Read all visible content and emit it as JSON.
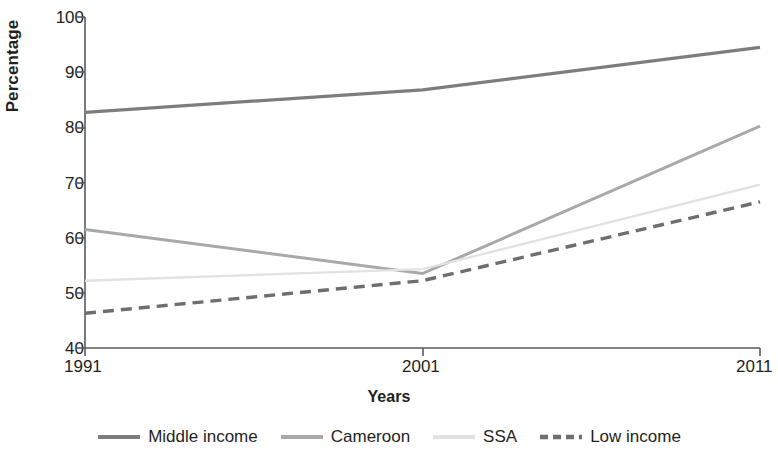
{
  "chart_data": {
    "type": "line",
    "title": "",
    "xlabel": "Years",
    "ylabel": "Percentage",
    "x": [
      1991,
      2001,
      2011
    ],
    "categories": [
      "1991",
      "2001",
      "2011"
    ],
    "xtick_labels": [
      "1991",
      "2001",
      "2011"
    ],
    "ytick_labels": [
      "40",
      "50",
      "60",
      "70",
      "80",
      "90",
      "100"
    ],
    "yticks": [
      40,
      50,
      60,
      70,
      80,
      90,
      100
    ],
    "ylim": [
      40,
      100
    ],
    "xlim": [
      1991,
      2011
    ],
    "grid": false,
    "legend_position": "bottom",
    "series": [
      {
        "name": "Middle income",
        "values": [
          82.7,
          86.8,
          94.5
        ],
        "color": "#7d7d7d",
        "style": "solid",
        "width": 3.2
      },
      {
        "name": "Cameroon",
        "values": [
          61.5,
          53.5,
          80.2
        ],
        "color": "#a9a9a9",
        "style": "solid",
        "width": 3.0
      },
      {
        "name": "SSA",
        "values": [
          52.2,
          54.3,
          69.6
        ],
        "color": "#e2e2e2",
        "style": "solid",
        "width": 2.4
      },
      {
        "name": "Low income",
        "values": [
          46.3,
          52.2,
          66.5
        ],
        "color": "#6e6e6e",
        "style": "dashed",
        "width": 3.4
      }
    ]
  },
  "legend": {
    "items": [
      {
        "label": "Middle income"
      },
      {
        "label": "Cameroon"
      },
      {
        "label": "SSA"
      },
      {
        "label": "Low income"
      }
    ]
  },
  "axes": {
    "y_title": "Percentage",
    "x_title": "Years"
  }
}
